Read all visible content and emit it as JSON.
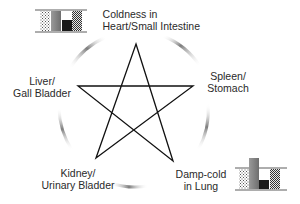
{
  "diagram": {
    "nodes": [
      {
        "id": "top",
        "line1": "Coldness in",
        "line2": "Heart/Small Intestine"
      },
      {
        "id": "right",
        "line1": "Spleen/",
        "line2": "Stomach"
      },
      {
        "id": "bottom_right",
        "line1": "Damp-cold",
        "line2": "in Lung"
      },
      {
        "id": "bottom_left",
        "line1": "Kidney/",
        "line2": "Urinary Bladder"
      },
      {
        "id": "left",
        "line1": "Liver/",
        "line2": "Gall Bladder"
      }
    ],
    "edges": "pentagram connecting all five nodes",
    "bar_glyphs": [
      {
        "near": "Coldness in Heart/Small Intestine",
        "bars": [
          "dotted",
          "gray-gradient",
          "black-short",
          "checkered"
        ]
      },
      {
        "near": "Damp-cold in Lung",
        "bars": [
          "dotted",
          "gray-gradient-tall",
          "black-short",
          "checkered"
        ]
      }
    ],
    "colors": {
      "star_stroke": "#111111",
      "arc": "#8a8a8a",
      "text": "#2a2a2a"
    }
  }
}
